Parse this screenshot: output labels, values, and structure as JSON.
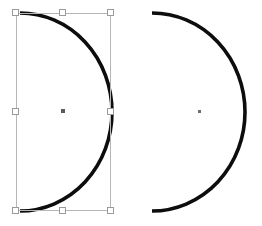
{
  "canvas": {
    "width": 262,
    "height": 226,
    "background_color": "#ffffff",
    "label": "vector-editor-canvas"
  },
  "style": {
    "stroke_color": "#0d0d0d",
    "stroke_width": 3.6,
    "fill": "none",
    "linecap": "butt",
    "selection_outline_color": "#b6b6b9",
    "handle_fill_color": "#ffffff",
    "handle_border_color": "#9a9a9e",
    "center_dot_color": "#5b5b5f"
  },
  "shapes": [
    {
      "id": "arc-left",
      "name": "Selected arc path",
      "type": "open-arc",
      "selected": true,
      "start": {
        "x": 20,
        "y": 13
      },
      "end": {
        "x": 20,
        "y": 211
      },
      "apex": {
        "x": 112,
        "y": 112
      },
      "radius_x": 92,
      "radius_y": 99,
      "sweep": "right",
      "center_marker": {
        "x": 63,
        "y": 111
      }
    },
    {
      "id": "arc-right",
      "name": "Unselected arc path",
      "type": "open-arc",
      "selected": false,
      "start": {
        "x": 152,
        "y": 13
      },
      "end": {
        "x": 152,
        "y": 211
      },
      "apex": {
        "x": 245,
        "y": 112
      },
      "radius_x": 93,
      "radius_y": 99,
      "sweep": "right",
      "center_marker": {
        "x": 199,
        "y": 111
      }
    }
  ],
  "selection": {
    "target_shape_id": "arc-left",
    "bbox": {
      "x": 16,
      "y": 13,
      "width": 95,
      "height": 198
    },
    "handles": [
      {
        "id": "handle-nw",
        "label": "top-left",
        "x": 16,
        "y": 13
      },
      {
        "id": "handle-n",
        "label": "top-center",
        "x": 63,
        "y": 13
      },
      {
        "id": "handle-ne",
        "label": "top-right",
        "x": 111,
        "y": 13
      },
      {
        "id": "handle-w",
        "label": "middle-left",
        "x": 16,
        "y": 112
      },
      {
        "id": "handle-e",
        "label": "middle-right",
        "x": 111,
        "y": 112
      },
      {
        "id": "handle-sw",
        "label": "bottom-left",
        "x": 16,
        "y": 211
      },
      {
        "id": "handle-s",
        "label": "bottom-center",
        "x": 63,
        "y": 211
      },
      {
        "id": "handle-se",
        "label": "bottom-right",
        "x": 111,
        "y": 211
      }
    ],
    "center_marker": {
      "x": 63,
      "y": 111
    }
  }
}
